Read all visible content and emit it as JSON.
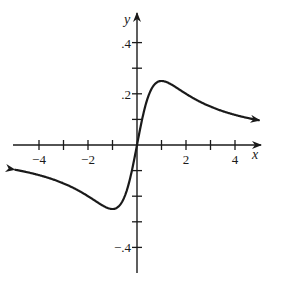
{
  "chart_data": {
    "type": "line",
    "title": "",
    "xlabel": "x",
    "ylabel": "y",
    "xlim": [
      -5,
      5
    ],
    "ylim": [
      -0.5,
      0.5
    ],
    "grid": false,
    "legend": null,
    "x_ticks": [
      -4,
      -3,
      -2,
      -1,
      1,
      2,
      3,
      4
    ],
    "x_tick_labels": [
      {
        "value": -4,
        "label": "−4"
      },
      {
        "value": -2,
        "label": "−2"
      },
      {
        "value": 2,
        "label": "2"
      },
      {
        "value": 4,
        "label": "4"
      }
    ],
    "y_ticks": [
      -0.4,
      -0.3,
      -0.2,
      -0.1,
      0.1,
      0.2,
      0.3,
      0.4
    ],
    "y_tick_labels": [
      {
        "value": 0.4,
        "label": ".4"
      },
      {
        "value": 0.2,
        "label": ".2"
      },
      {
        "value": -0.4,
        "label": "−.4"
      }
    ],
    "series": [
      {
        "name": "f(x)",
        "x": [
          -5,
          -4,
          -3,
          -2,
          -1.5,
          -1,
          -0.5,
          0,
          0.5,
          1,
          1.5,
          2,
          3,
          4,
          5
        ],
        "y": [
          -0.096,
          -0.118,
          -0.15,
          -0.2,
          -0.23,
          -0.25,
          -0.2,
          0,
          0.2,
          0.25,
          0.23,
          0.2,
          0.15,
          0.118,
          0.096
        ],
        "arrows_at_ends": true
      }
    ],
    "annotations": [
      "maximum near (1, 0.25)",
      "minimum near (-1, -0.25)"
    ]
  },
  "axes": {
    "x_label": "x",
    "y_label": "y"
  },
  "layout": {
    "origin_px": [
      137,
      145
    ],
    "px_per_x_unit": 24.5,
    "px_per_y_unit": 256,
    "line_color": "#1a1a1a"
  }
}
